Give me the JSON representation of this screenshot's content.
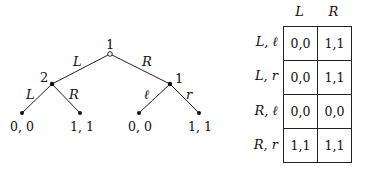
{
  "tree": {
    "root": {
      "player": "1",
      "x": 110,
      "y": 54
    },
    "nodes": [
      {
        "player": "2",
        "x": 52,
        "y": 84
      },
      {
        "player": "1",
        "x": 170,
        "y": 84
      }
    ],
    "edges_top": [
      {
        "label": "L"
      },
      {
        "label": "R"
      }
    ],
    "edges_left": [
      {
        "label": "L"
      },
      {
        "label": "R"
      }
    ],
    "edges_right": [
      {
        "label": "ℓ"
      },
      {
        "label": "r"
      }
    ],
    "leaves": [
      {
        "payoff": "0, 0"
      },
      {
        "payoff": "1, 1"
      },
      {
        "payoff": "0, 0"
      },
      {
        "payoff": "1, 1"
      }
    ]
  },
  "matrix": {
    "col_headers": [
      "L",
      "R"
    ],
    "rows": [
      {
        "label": "L, ℓ",
        "cells": [
          "0,0",
          "1,1"
        ]
      },
      {
        "label": "L, r",
        "cells": [
          "0,0",
          "1,1"
        ]
      },
      {
        "label": "R, ℓ",
        "cells": [
          "0,0",
          "0,0"
        ]
      },
      {
        "label": "R, r",
        "cells": [
          "1,1",
          "1,1"
        ]
      }
    ]
  }
}
